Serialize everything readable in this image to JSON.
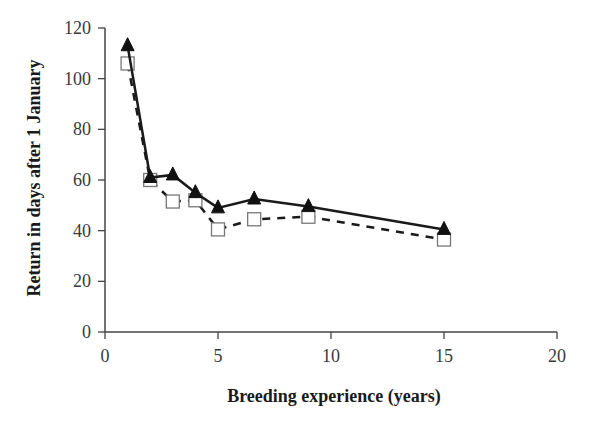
{
  "chart_data": {
    "type": "line",
    "title": "",
    "xlabel": "Breeding experience (years)",
    "ylabel": "Return in days after 1 January",
    "xlim": [
      0,
      20
    ],
    "ylim": [
      0,
      120
    ],
    "x_ticks": [
      0,
      5,
      10,
      15,
      20
    ],
    "y_ticks": [
      0,
      20,
      40,
      60,
      80,
      100,
      120
    ],
    "grid": false,
    "legend": null,
    "series": [
      {
        "name": "filled-triangles-solid-line",
        "marker": "triangle-filled",
        "line": "solid",
        "color": "#1a1a1a",
        "x": [
          1,
          2,
          3,
          4,
          5,
          6.6,
          9,
          15
        ],
        "values": [
          113,
          61,
          62,
          55,
          49,
          52.5,
          49.5,
          40.5
        ]
      },
      {
        "name": "open-squares-dashed-line",
        "marker": "square-open",
        "line": "dashed",
        "color": "#1a1a1a",
        "x": [
          1,
          2,
          3,
          4,
          5,
          6.6,
          9,
          15
        ],
        "values": [
          106,
          60,
          51.5,
          52,
          40.5,
          44.5,
          45.5,
          36.5
        ]
      }
    ]
  },
  "axes": {
    "x_title": "Breeding experience (years)",
    "y_title": "Return in days after 1 January",
    "x_tick_labels": [
      "0",
      "5",
      "10",
      "15",
      "20"
    ],
    "y_tick_labels": [
      "0",
      "20",
      "40",
      "60",
      "80",
      "100",
      "120"
    ]
  }
}
